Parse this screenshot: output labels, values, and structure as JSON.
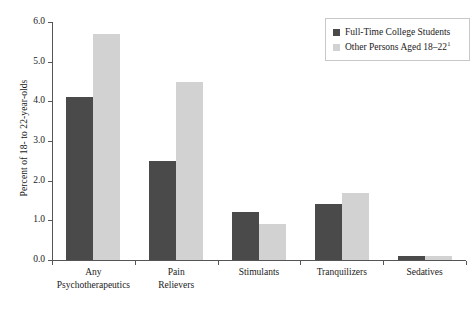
{
  "chart_data": {
    "type": "bar",
    "title": "",
    "subtitle": "",
    "xlabel": "",
    "ylabel": "Percent of 18- to 22-year-olds",
    "ylim": [
      0.0,
      6.0
    ],
    "ytick_step": 1.0,
    "ytick_labels": [
      "0.0",
      "1.0",
      "2.0",
      "3.0",
      "4.0",
      "5.0",
      "6.0"
    ],
    "ytick_values": [
      0.0,
      1.0,
      2.0,
      3.0,
      4.0,
      5.0,
      6.0
    ],
    "grid": false,
    "legend_position": "top-right",
    "categories": [
      "Any\nPsychotherapeutics",
      "Pain\nRelievers",
      "Stimulants",
      "Tranquilizers",
      "Sedatives"
    ],
    "series": [
      {
        "name": "Full-Time College Students",
        "color": "#4a4a4a",
        "values": [
          4.1,
          2.5,
          1.2,
          1.4,
          0.1
        ]
      },
      {
        "name": "Other Persons Aged 18–22",
        "name_superscript": "1",
        "color": "#d2d2d2",
        "values": [
          5.7,
          4.5,
          0.9,
          1.7,
          0.1
        ]
      }
    ]
  },
  "legend": {
    "items": [
      {
        "label": "Full-Time College Students",
        "sup": "",
        "swatch": "legend-swatch-dark"
      },
      {
        "label": "Other Persons Aged 18–22",
        "sup": "1",
        "swatch": "legend-swatch-light"
      }
    ]
  }
}
